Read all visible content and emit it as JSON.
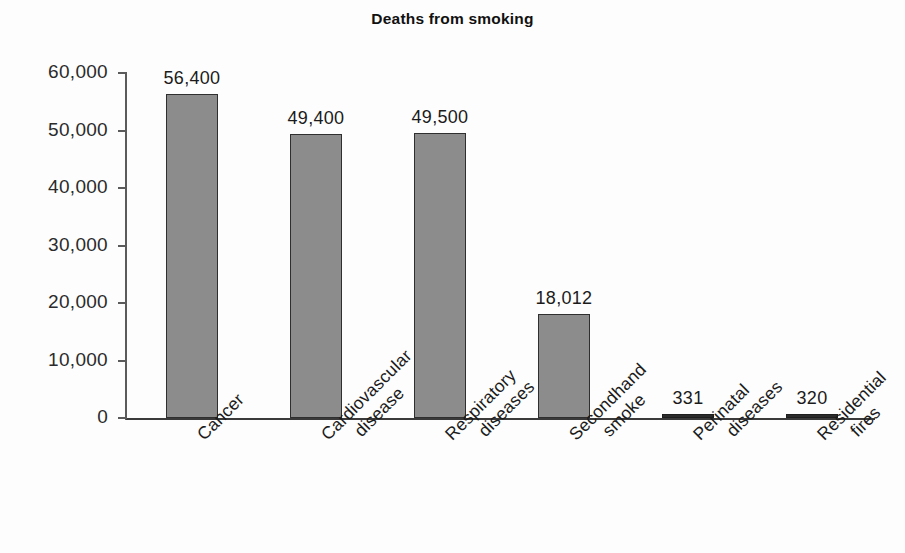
{
  "chart_data": {
    "type": "bar",
    "title": "Deaths from smoking",
    "xlabel": "",
    "ylabel": "",
    "categories": [
      "Cancer",
      "Cardiovascular disease",
      "Respiratory diseases",
      "Secondhand smoke",
      "Perinatal diseases",
      "Residential fires"
    ],
    "category_lines": [
      [
        "Cancer"
      ],
      [
        "Cardiovascular",
        "disease"
      ],
      [
        "Respiratory",
        "diseases"
      ],
      [
        "Secondhand",
        "smoke"
      ],
      [
        "Perinatal",
        "diseases"
      ],
      [
        "Residential",
        "fires"
      ]
    ],
    "values": [
      56400,
      49400,
      49500,
      18012,
      331,
      320
    ],
    "value_labels": [
      "56,400",
      "49,400",
      "49,500",
      "18,012",
      "331",
      "320"
    ],
    "ylim": [
      0,
      60000
    ],
    "ytick_values": [
      60000,
      50000,
      40000,
      30000,
      20000,
      10000,
      0
    ],
    "ytick_labels": [
      "60,000",
      "50,000",
      "40,000",
      "30,000",
      "20,000",
      "10,000",
      "0"
    ],
    "grid": false,
    "legend": null,
    "bar_color": "#8c8c8c",
    "bar_edge_color": "#2f2f2f",
    "axis_color": "#3a3a3a",
    "text_color": "#1b1b1b",
    "background": "#ffffff"
  }
}
